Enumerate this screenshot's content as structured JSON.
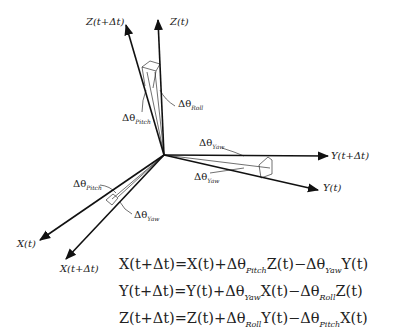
{
  "diagram": {
    "axes": {
      "z_t": "Z(t)",
      "z_dt": "Z(t+Δt)",
      "y_t": "Y(t)",
      "y_dt": "Y(t+Δt)",
      "x_t": "X(t)",
      "x_dt": "X(t+Δt)"
    },
    "angles": {
      "roll_base": "Δθ",
      "roll_sub": "Roll",
      "pitch_top_base": "Δθ",
      "pitch_top_sub": "Pitch",
      "yaw_top_base": "Δθ",
      "yaw_top_sub": "Yaw",
      "yaw_right_base": "Δθ",
      "yaw_right_sub": "Yaw",
      "pitch_left_base": "Δθ",
      "pitch_left_sub": "Pitch",
      "yaw_left_base": "Δθ",
      "yaw_left_sub": "Yaw"
    },
    "equations": [
      {
        "lhs": "X(t+Δt)=X(t)+Δθ",
        "s1": "Pitch",
        "m1": "Z(t)−Δθ",
        "s2": "Yaw",
        "m2": "Y(t)"
      },
      {
        "lhs": "Y(t+Δt)=Y(t)+Δθ",
        "s1": "Yaw",
        "m1": "X(t)−Δθ",
        "s2": "Roll",
        "m2": "Z(t)"
      },
      {
        "lhs": "Z(t+Δt)=Z(t)+Δθ",
        "s1": "Roll",
        "m1": "Y(t)−Δθ",
        "s2": "Pitch",
        "m2": "X(t)"
      }
    ]
  }
}
